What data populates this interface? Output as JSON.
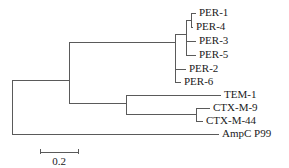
{
  "figure": {
    "type": "phylogenetic-tree",
    "orientation": "left-to-right-rectangular",
    "background_color": "#ffffff",
    "line_color": "#5a5a5a",
    "text_color": "#1a1a1a"
  },
  "scale_bar": {
    "label": "0.2",
    "value": 0.2,
    "x_start": 40,
    "x_end": 78,
    "y": 152
  },
  "taxa": [
    {
      "id": "per-1",
      "label": "PER-1",
      "tip_x": 196,
      "y": 13,
      "label_x": 199
    },
    {
      "id": "per-4",
      "label": "PER-4",
      "tip_x": 193,
      "y": 27,
      "label_x": 196
    },
    {
      "id": "per-3",
      "label": "PER-3",
      "tip_x": 196,
      "y": 41,
      "label_x": 199
    },
    {
      "id": "per-5",
      "label": "PER-5",
      "tip_x": 196,
      "y": 55,
      "label_x": 199
    },
    {
      "id": "per-2",
      "label": "PER-2",
      "tip_x": 186,
      "y": 69,
      "label_x": 189
    },
    {
      "id": "per-6",
      "label": "PER-6",
      "tip_x": 181,
      "y": 82,
      "label_x": 184
    },
    {
      "id": "tem-1",
      "label": "TEM-1",
      "tip_x": 221,
      "y": 95,
      "label_x": 224
    },
    {
      "id": "ctx-m-9",
      "label": "CTX-M-9",
      "tip_x": 210,
      "y": 108,
      "label_x": 213
    },
    {
      "id": "ctx-m-44",
      "label": "CTX-M-44",
      "tip_x": 203,
      "y": 121,
      "label_x": 206
    },
    {
      "id": "ampc-p99",
      "label": "AmpC P99",
      "tip_x": 219,
      "y": 134,
      "label_x": 222
    }
  ],
  "chart_data": {
    "type": "tree",
    "title": "",
    "newick": "((((PER-1,PER-4),PER-3,PER-5),PER-2,PER-6),(TEM-1,(CTX-M-9,CTX-M-44)),AmpC P99);",
    "scale_units": "substitutions per site",
    "scale_bar_value": 0.2,
    "leaf_labels": [
      "PER-1",
      "PER-4",
      "PER-3",
      "PER-5",
      "PER-2",
      "PER-6",
      "TEM-1",
      "CTX-M-9",
      "CTX-M-44",
      "AmpC P99"
    ],
    "clades": [
      {
        "name": "PER group",
        "members": [
          "PER-1",
          "PER-4",
          "PER-3",
          "PER-5",
          "PER-2",
          "PER-6"
        ]
      },
      {
        "name": "PER core",
        "members": [
          "PER-1",
          "PER-4",
          "PER-3",
          "PER-5"
        ]
      },
      {
        "name": "PER-1/PER-4",
        "members": [
          "PER-1",
          "PER-4"
        ]
      },
      {
        "name": "TEM/CTX-M",
        "members": [
          "TEM-1",
          "CTX-M-9",
          "CTX-M-44"
        ]
      },
      {
        "name": "CTX-M pair",
        "members": [
          "CTX-M-9",
          "CTX-M-44"
        ]
      },
      {
        "name": "outgroup",
        "members": [
          "AmpC P99"
        ]
      }
    ],
    "nodes": [
      {
        "id": "root",
        "x": 12,
        "y_top": 80,
        "y_bottom": 134
      },
      {
        "id": "ingroup",
        "x": 69,
        "y_top": 42,
        "y_bottom": 103
      },
      {
        "id": "per-group",
        "x": 175,
        "y_top": 34,
        "y_bottom": 82
      },
      {
        "id": "per-core",
        "x": 186,
        "y_top": 20,
        "y_bottom": 55
      },
      {
        "id": "per-1-4",
        "x": 191,
        "y_top": 13,
        "y_bottom": 27
      },
      {
        "id": "tem-ctx",
        "x": 126,
        "y_top": 95,
        "y_bottom": 114
      },
      {
        "id": "ctx-pair",
        "x": 196,
        "y_top": 108,
        "y_bottom": 121
      }
    ]
  }
}
